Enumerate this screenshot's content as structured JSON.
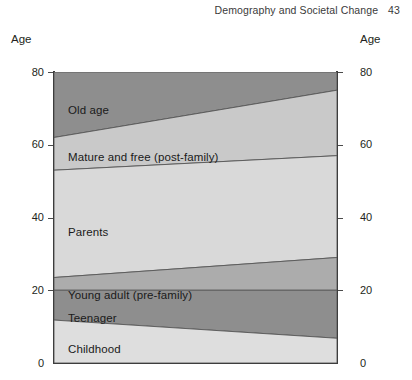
{
  "running_head": {
    "title": "Demography and Societal Change",
    "page_number": "43"
  },
  "axis": {
    "caption_left": "Age",
    "caption_right": "Age"
  },
  "chart_data": {
    "type": "area",
    "title": "Demography and Societal Change",
    "xlabel": "",
    "ylabel": "Age",
    "ylim": [
      0,
      80
    ],
    "xlim": [
      0,
      1
    ],
    "grid": false,
    "legend": "none",
    "tick_labels": [
      "80",
      "60",
      "40",
      "20",
      "0"
    ],
    "tick_values": [
      80,
      60,
      40,
      20,
      0
    ],
    "x": [
      0,
      1
    ],
    "bands": [
      {
        "name": "Old age",
        "label": "Old age",
        "color": "#8e8e8e",
        "lower": [
          62,
          75
        ],
        "upper": [
          80,
          80
        ],
        "label_x": 14,
        "label_y": 104
      },
      {
        "name": "Mature and free (post-family)",
        "label": "Mature and free (post-family)",
        "color": "#c9c9c9",
        "lower": [
          53,
          57
        ],
        "upper": [
          62,
          75
        ],
        "label_x": 14,
        "label_y": 151
      },
      {
        "name": "Parents",
        "label": "Parents",
        "color": "#d9d9d9",
        "lower": [
          23.5,
          29
        ],
        "upper": [
          53,
          57
        ],
        "label_x": 14,
        "label_y": 226
      },
      {
        "name": "Young adult (pre-family)",
        "label": "Young adult (pre-family)",
        "color": "#acacac",
        "lower": [
          20,
          20
        ],
        "upper": [
          23.5,
          29
        ],
        "label_x": 14,
        "label_y": 289
      },
      {
        "name": "Teenager",
        "label": "Teenager",
        "color": "#8e8e8e",
        "lower": [
          11.8,
          6.8
        ],
        "upper": [
          20,
          20
        ],
        "label_x": 14,
        "label_y": 312
      },
      {
        "name": "Childhood",
        "label": "Childhood",
        "color": "#dedede",
        "lower": [
          0,
          0
        ],
        "upper": [
          11.8,
          6.8
        ],
        "label_x": 14,
        "label_y": 343
      }
    ]
  }
}
